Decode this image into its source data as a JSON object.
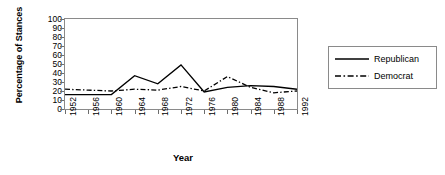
{
  "chart_data": {
    "type": "line",
    "title": "",
    "xlabel": "Year",
    "ylabel": "Percentage of Stances",
    "categories": [
      "1952",
      "1956",
      "1960",
      "1964",
      "1968",
      "1972",
      "1976",
      "1980",
      "1984",
      "1988",
      "1992"
    ],
    "x": [
      1952,
      1956,
      1960,
      1964,
      1968,
      1972,
      1976,
      1980,
      1984,
      1988,
      1992
    ],
    "series": [
      {
        "name": "Republican",
        "style": "solid",
        "color": "#000000",
        "values": [
          16,
          16,
          16,
          37,
          28,
          49,
          19,
          24,
          26,
          25,
          22
        ]
      },
      {
        "name": "Democrat",
        "style": "dash-dot",
        "color": "#000000",
        "values": [
          22,
          21,
          20,
          22,
          21,
          25,
          20,
          36,
          24,
          18,
          20
        ]
      }
    ],
    "ylim": [
      0,
      100
    ],
    "ytick_step": 10,
    "yticks": [
      "100",
      "90",
      "80",
      "70",
      "60",
      "50",
      "40",
      "30",
      "20",
      "10",
      "0"
    ],
    "grid": false,
    "legend_position": "right"
  },
  "legend": {
    "items": [
      {
        "label": "Republican"
      },
      {
        "label": "Democrat"
      }
    ]
  },
  "axes": {
    "y_title": "Percentage of Stances",
    "x_title": "Year"
  }
}
